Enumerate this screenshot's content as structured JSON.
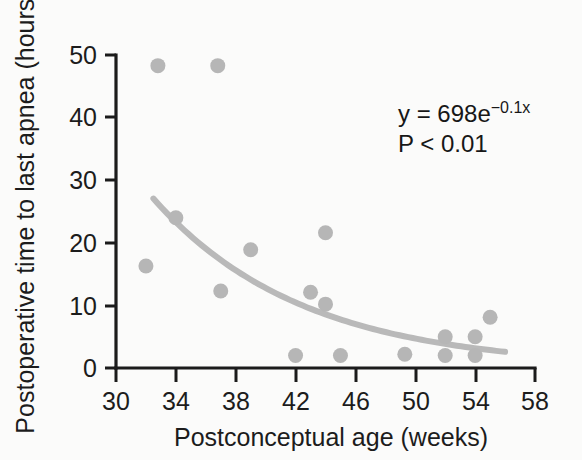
{
  "chart_data": {
    "type": "scatter",
    "title": "",
    "xlabel": "Postconceptual age (weeks)",
    "ylabel": "Postoperative time to last apnea (hours)",
    "xlim": [
      30,
      58
    ],
    "ylim": [
      0,
      50
    ],
    "xticks": [
      30,
      34,
      38,
      42,
      46,
      50,
      54,
      58
    ],
    "yticks": [
      0,
      10,
      20,
      30,
      40,
      50
    ],
    "grid": false,
    "legend": null,
    "point_color": "#b6b6b6",
    "curve_color": "#b9b9b9",
    "axis_color": "#1b1b1b",
    "points": [
      {
        "x": 32.8,
        "y": 48.3
      },
      {
        "x": 36.8,
        "y": 48.3
      },
      {
        "x": 34.0,
        "y": 24.0
      },
      {
        "x": 32.0,
        "y": 16.3
      },
      {
        "x": 37.0,
        "y": 12.3
      },
      {
        "x": 39.0,
        "y": 18.9
      },
      {
        "x": 42.0,
        "y": 2.0
      },
      {
        "x": 43.0,
        "y": 12.1
      },
      {
        "x": 44.0,
        "y": 21.6
      },
      {
        "x": 44.0,
        "y": 10.2
      },
      {
        "x": 45.0,
        "y": 2.0
      },
      {
        "x": 49.3,
        "y": 2.2
      },
      {
        "x": 52.0,
        "y": 5.0
      },
      {
        "x": 52.0,
        "y": 2.0
      },
      {
        "x": 54.0,
        "y": 5.0
      },
      {
        "x": 54.0,
        "y": 2.0
      },
      {
        "x": 55.0,
        "y": 8.1
      }
    ],
    "fit": {
      "equation_display": "y = 698e",
      "equation_exponent": "−0.1x",
      "p_value_display": "P < 0.01",
      "coefficient": 698,
      "rate": -0.1,
      "x_start": 32.5,
      "x_end": 56.0
    },
    "annotations": [
      {
        "name": "equation",
        "text": "y = 698e−0.1x"
      },
      {
        "name": "p-value",
        "text": "P < 0.01"
      }
    ]
  }
}
